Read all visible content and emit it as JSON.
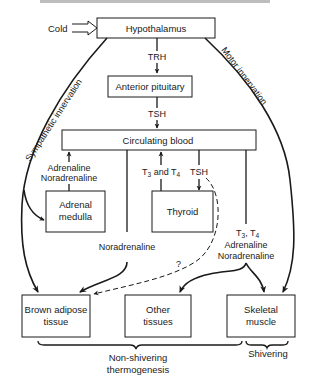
{
  "caption_fragment": "(cut-off heading text)",
  "input": {
    "label": "Cold"
  },
  "nodes": {
    "hypothalamus": "Hypothalamus",
    "anterior_pituitary": "Anterior pituitary",
    "circulating_blood": "Circulating blood",
    "adrenal_medulla": [
      "Adrenal",
      "medulla"
    ],
    "thyroid": "Thyroid",
    "brown_adipose": [
      "Brown adipose",
      "tissue"
    ],
    "other_tissues": [
      "Other",
      "tissues"
    ],
    "skeletal_muscle": [
      "Skeletal",
      "muscle"
    ]
  },
  "edges": {
    "trh": "TRH",
    "tsh_pituitary": "TSH",
    "adrenal_out": [
      "Adrenaline",
      "Noradrenaline"
    ],
    "t3_t4": {
      "t": "T",
      "s3": "3",
      "and": " and T",
      "s4": "4"
    },
    "tsh_thyroid": "TSH",
    "noradrenaline": "Noradrenaline",
    "question": "?",
    "right_hormones": {
      "line1_t": "T",
      "line1_s3": "3",
      "line1_mid": ", T",
      "line1_s4": "4",
      "line2": "Adrenaline",
      "line3": "Noradrenaline"
    },
    "sympathetic": "Sympathetic innervation",
    "motor": "Motor innervation"
  },
  "groups": {
    "non_shivering": [
      "Non-shivering",
      "thermogenesis"
    ],
    "shivering": "Shivering"
  },
  "colors": {
    "ink": "#1a1a1a",
    "background": "#ffffff"
  }
}
